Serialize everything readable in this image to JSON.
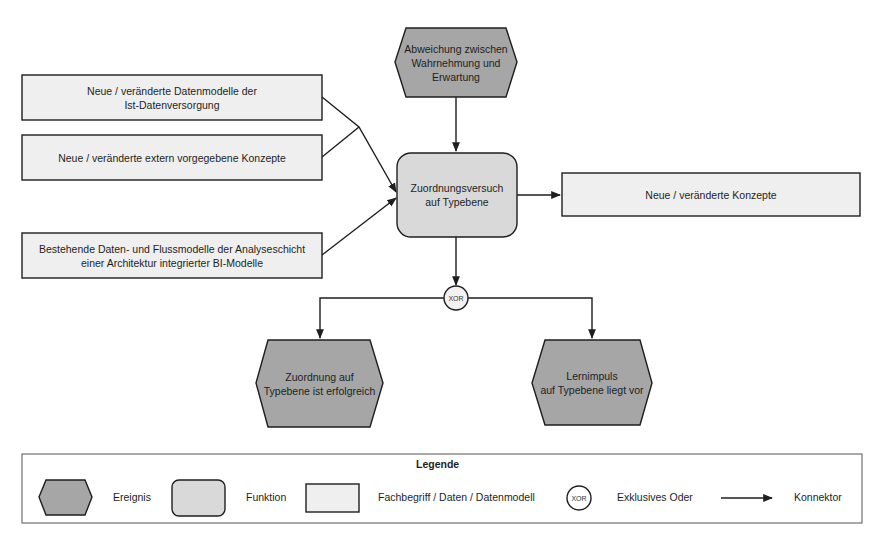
{
  "diagram": {
    "type": "EPK",
    "colors": {
      "event_fill": "#a6a6a6",
      "function_fill": "#d9d9d9",
      "data_fill": "#efefef",
      "stroke": "#1e1e1e"
    },
    "nodes": {
      "event_top": {
        "kind": "event",
        "label": "Abweichung zwischen\nWahrnehmung und\nErwartung"
      },
      "data_1": {
        "kind": "data",
        "label": "Neue / veränderte Datenmodelle der\nIst-Datenversorgung"
      },
      "data_2": {
        "kind": "data",
        "label": "Neue / veränderte extern vorgegebene Konzepte"
      },
      "data_3": {
        "kind": "data",
        "label": "Bestehende Daten- und Flussmodelle der Analyseschicht\neiner Architektur integrierter BI-Modelle"
      },
      "function_main": {
        "kind": "function",
        "label": "Zuordnungsversuch\nauf Typebene"
      },
      "data_out": {
        "kind": "data",
        "label": "Neue / veränderte Konzepte"
      },
      "xor": {
        "kind": "connector",
        "label": "XOR"
      },
      "event_left": {
        "kind": "event",
        "label": "Zuordnung auf\nTypebene ist erfolgreich"
      },
      "event_right": {
        "kind": "event",
        "label": "Lernimpuls\nauf Typebene liegt vor"
      }
    },
    "edges": [
      {
        "from": "event_top",
        "to": "function_main"
      },
      {
        "from": "data_1",
        "to": "function_main"
      },
      {
        "from": "data_2",
        "to": "function_main"
      },
      {
        "from": "data_3",
        "to": "function_main"
      },
      {
        "from": "function_main",
        "to": "data_out"
      },
      {
        "from": "function_main",
        "to": "xor"
      },
      {
        "from": "xor",
        "to": "event_left"
      },
      {
        "from": "xor",
        "to": "event_right"
      }
    ]
  },
  "legend": {
    "title": "Legende",
    "items": [
      {
        "symbol": "event",
        "label": "Ereignis"
      },
      {
        "symbol": "function",
        "label": "Funktion"
      },
      {
        "symbol": "data",
        "label": "Fachbegriff / Daten / Datenmodell"
      },
      {
        "symbol": "xor",
        "symbol_text": "XOR",
        "label": "Exklusives Oder"
      },
      {
        "symbol": "arrow",
        "label": "Konnektor"
      }
    ]
  }
}
